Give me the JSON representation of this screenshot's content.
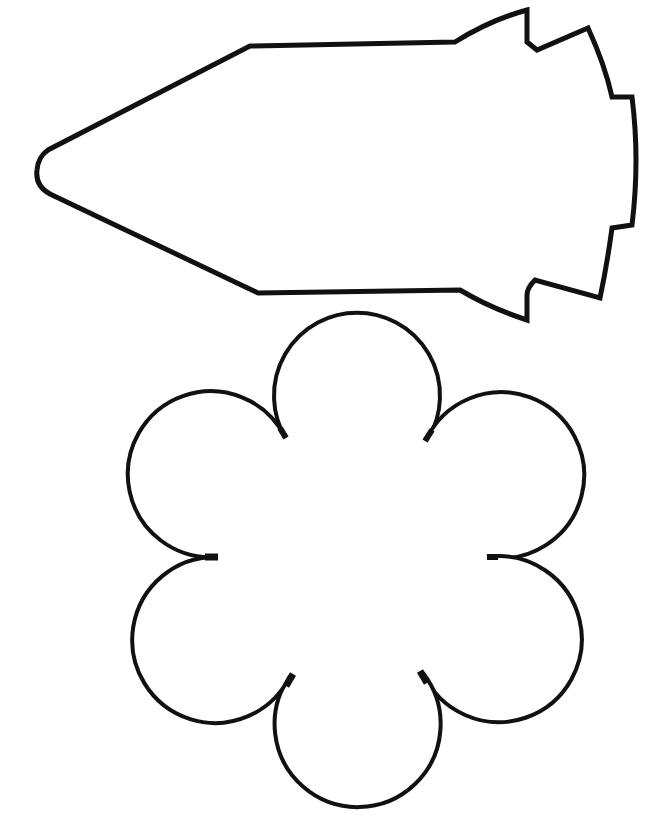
{
  "page": {
    "background": "#ffffff",
    "width": 654,
    "height": 826
  },
  "shapes": [
    {
      "name": "rocket",
      "type": "outline-template",
      "stroke_color": "#111111",
      "fill_color": "#ffffff",
      "stroke_width": 5
    },
    {
      "name": "flower",
      "type": "outline-template",
      "petals": 6,
      "stroke_color": "#111111",
      "fill_color": "#ffffff",
      "stroke_width": 4
    }
  ]
}
